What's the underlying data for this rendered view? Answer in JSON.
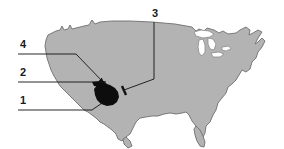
{
  "figure": {
    "type": "labeled-map-diagram",
    "title": "",
    "region": "United States",
    "background_color": "#ffffff"
  },
  "map": {
    "name": "united-states-outline",
    "fill_color": "#b3b3b3",
    "stroke_color": "#6e6e6e",
    "lakes_fill_color": "#ffffff",
    "highlight": {
      "name": "southern-california-highlight",
      "fill_color": "#0d0d0d"
    }
  },
  "callouts": [
    {
      "id": "callout-1",
      "label": "1",
      "label_x": 20,
      "label_y": 104,
      "leader": "M 18 110 L 92 110 L 118 92"
    },
    {
      "id": "callout-2",
      "label": "2",
      "label_x": 20,
      "label_y": 76,
      "leader": "M 18 82 L 106 82"
    },
    {
      "id": "callout-3",
      "label": "3",
      "label_x": 152,
      "label_y": 17,
      "leader": "M 154 22 L 154 79 L 124 90"
    },
    {
      "id": "callout-4",
      "label": "4",
      "label_x": 20,
      "label_y": 48,
      "leader": "M 18 54 L 76 54 L 104 83"
    }
  ]
}
